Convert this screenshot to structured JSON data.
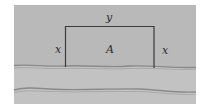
{
  "diagram": {
    "labels": {
      "top_side": "y",
      "left_side": "x",
      "right_side": "x",
      "area": "A"
    },
    "colors": {
      "background": "#b9b9b9",
      "river": "#c4c4c4",
      "river_bank_line": "#8a8a8a",
      "fence_line": "#3a3a3a",
      "text": "#2a2a2a"
    },
    "rectangle": {
      "left": 65,
      "right": 154,
      "top": 26,
      "bottom": 67
    }
  }
}
